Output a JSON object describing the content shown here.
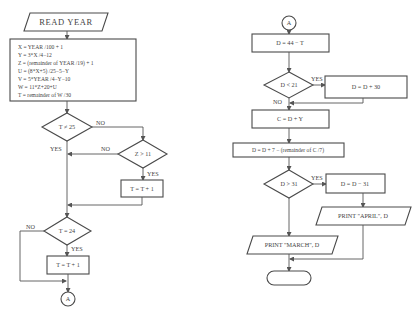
{
  "flowchart": {
    "left": {
      "input": "READ YEAR",
      "compute_lines": [
        "X = YEAR /100 + 1",
        "Y = 3*X /4−12",
        "Z = (remainder of YEAR /19) + 1",
        "U = (8*X+5) /25−5−Y",
        "V = 5*YEAR /4−Y−10",
        "W = 11*Z+20+U",
        "T = remainder of W /30"
      ],
      "decision_t25": "T ≠ 25",
      "decision_t25_no": "NO",
      "decision_t25_yes": "YES",
      "decision_z11": "Z > 11",
      "decision_z11_no": "NO",
      "decision_z11_yes": "YES",
      "process_inc1": "T = T + 1",
      "decision_t24": "T = 24",
      "decision_t24_no": "NO",
      "decision_t24_yes": "YES",
      "process_inc2": "T = T + 1",
      "connector": "A"
    },
    "right": {
      "connector": "A",
      "process_d": "D = 44 − T",
      "decision_d21": "D < 21",
      "decision_d21_yes": "YES",
      "decision_d21_no": "NO",
      "process_d30": "D = D + 30",
      "process_c": "C = D + Y",
      "process_d7": "D = D + 7 − (remainder of C /7)",
      "decision_d31": "D > 31",
      "decision_d31_yes": "YES",
      "process_d31": "D = D − 31",
      "output_april": "PRINT \"APRIL\", D",
      "output_march": "PRINT \"MARCH\", D",
      "terminal": ""
    }
  }
}
